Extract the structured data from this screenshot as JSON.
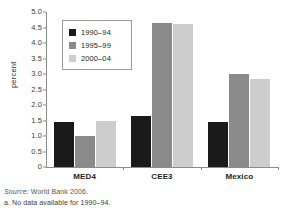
{
  "chart_data": {
    "type": "bar",
    "title": "",
    "xlabel": "",
    "ylabel": "percent",
    "ylim": [
      0,
      5.0
    ],
    "ytick_step": 0.5,
    "grid": false,
    "legend_position": "upper-left-inside",
    "categories": [
      "MED4",
      "CEE3",
      "Mexico"
    ],
    "yticks": [
      "0",
      "0.5",
      "1.0",
      "1.5",
      "2.0",
      "2.5",
      "3.0",
      "3.5",
      "4.0",
      "4.5",
      "5.0"
    ],
    "ytick_values": [
      0,
      0.5,
      1.0,
      1.5,
      2.0,
      2.5,
      3.0,
      3.5,
      4.0,
      4.5,
      5.0
    ],
    "series": [
      {
        "name": "1990–94",
        "color": "#1a1a1a",
        "values": [
          1.45,
          1.65,
          1.45
        ]
      },
      {
        "name": "1995–99",
        "color": "#8a8a8a",
        "values": [
          1.0,
          4.65,
          3.0
        ]
      },
      {
        "name": "2000–04",
        "color": "#cdcdcd",
        "values": [
          1.5,
          4.6,
          2.85
        ]
      }
    ]
  },
  "legend": {
    "items": [
      {
        "label": "1990–94",
        "color": "#1a1a1a"
      },
      {
        "label": "1995–99",
        "color": "#8a8a8a"
      },
      {
        "label": "2000–04",
        "color": "#cdcdcd"
      }
    ]
  },
  "footnotes": {
    "source_prefix": "Source:",
    "source_rest": " World Bank 2006.",
    "note_a": "a. No data available for 1990–94."
  }
}
